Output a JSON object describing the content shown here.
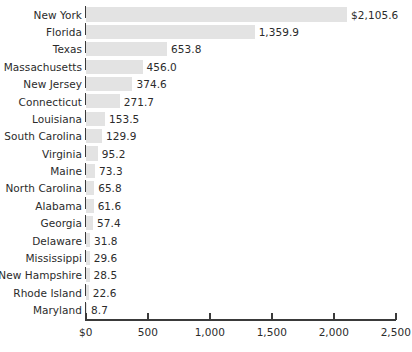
{
  "chart_data": {
    "type": "bar",
    "orientation": "horizontal",
    "title": "",
    "subtitle": "",
    "xlabel": "",
    "ylabel": "",
    "xlim": [
      0,
      2500
    ],
    "grid": false,
    "legend": null,
    "bar_color": "#e3e3e3",
    "text_color": "#2b2b2b",
    "axis_color": "#3a3a3a",
    "xticks": [
      0,
      500,
      1000,
      1500,
      2000,
      2500
    ],
    "xtick_labels": [
      "$0",
      "500",
      "1,000",
      "1,500",
      "2,000",
      "2,500"
    ],
    "categories": [
      "New York",
      "Florida",
      "Texas",
      "Massachusetts",
      "New Jersey",
      "Connecticut",
      "Louisiana",
      "South Carolina",
      "Virginia",
      "Maine",
      "North Carolina",
      "Alabama",
      "Georgia",
      "Delaware",
      "Mississippi",
      "New Hampshire",
      "Rhode Island",
      "Maryland"
    ],
    "values": [
      2105.6,
      1359.9,
      653.8,
      456.0,
      374.6,
      271.7,
      153.5,
      129.9,
      95.2,
      73.3,
      65.8,
      61.6,
      57.4,
      31.8,
      29.6,
      28.5,
      22.6,
      8.7
    ],
    "data_labels": [
      "$2,105.6",
      "1,359.9",
      "653.8",
      "456.0",
      "374.6",
      "271.7",
      "153.5",
      "129.9",
      "95.2",
      "73.3",
      "65.8",
      "61.6",
      "57.4",
      "31.8",
      "29.6",
      "28.5",
      "22.6",
      "8.7"
    ]
  }
}
